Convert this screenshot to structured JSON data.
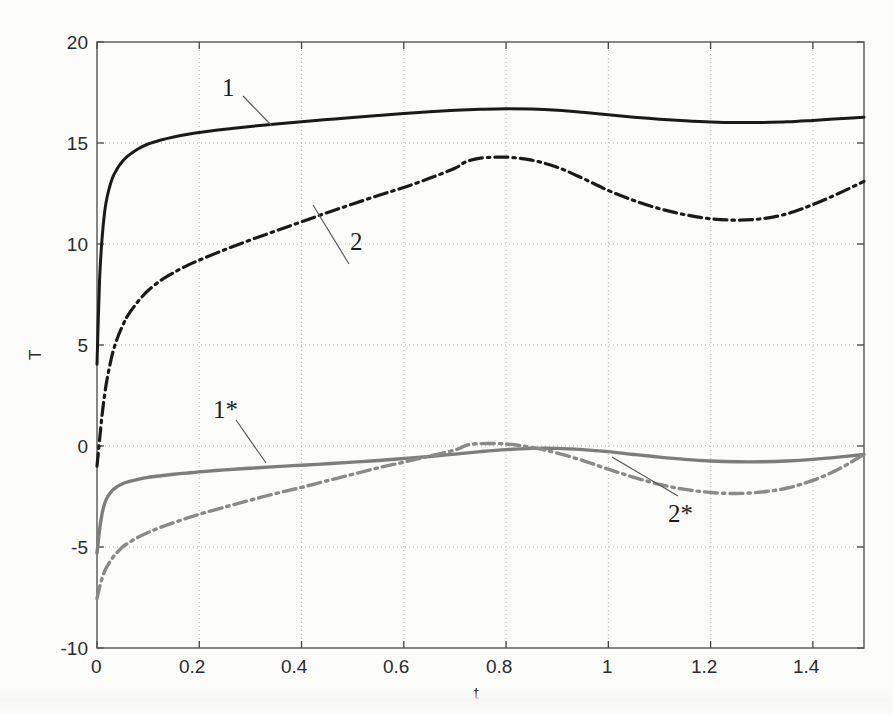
{
  "chart_data": {
    "type": "line",
    "title": "",
    "xlabel": "t",
    "ylabel": "T",
    "xlim": [
      0,
      1.5
    ],
    "ylim": [
      -10,
      20
    ],
    "grid": true,
    "legend_position": "inline-annotations",
    "xticks": [
      "0",
      "0.2",
      "0.4",
      "0.6",
      "0.8",
      "1",
      "1.2",
      "1.4"
    ],
    "xtick_values": [
      0,
      0.2,
      0.4,
      0.6,
      0.8,
      1,
      1.2,
      1.4
    ],
    "yticks": [
      "20",
      "15",
      "10",
      "5",
      "0",
      "-5",
      "-10"
    ],
    "ytick_values": [
      20,
      15,
      10,
      5,
      0,
      -5,
      -10
    ],
    "annotations": [
      {
        "label": "1",
        "x": 0.255,
        "y": 18.05
      },
      {
        "label": "2",
        "x": 0.505,
        "y": 10.45
      },
      {
        "label": "1*",
        "x": 0.24,
        "y": 2.2
      },
      {
        "label": "2*",
        "x": 0.74,
        "y": -5.45
      }
    ],
    "series": [
      {
        "name": "1",
        "style": "solid",
        "color": "#1a1a1a",
        "width": 3.0,
        "x": [
          0.0,
          0.005,
          0.01,
          0.015,
          0.02,
          0.03,
          0.04,
          0.05,
          0.06,
          0.08,
          0.1,
          0.125,
          0.15,
          0.175,
          0.2,
          0.25,
          0.3,
          0.35,
          0.4,
          0.45,
          0.5,
          0.55,
          0.6,
          0.65,
          0.7,
          0.75,
          0.8,
          0.85,
          0.9,
          0.95,
          1.0,
          1.05,
          1.1,
          1.15,
          1.2,
          1.25,
          1.3,
          1.35,
          1.4,
          1.45,
          1.5
        ],
        "y": [
          4.05,
          8.2,
          10.3,
          11.6,
          12.35,
          13.25,
          13.75,
          14.1,
          14.35,
          14.7,
          14.95,
          15.15,
          15.3,
          15.42,
          15.52,
          15.68,
          15.82,
          15.94,
          16.05,
          16.16,
          16.26,
          16.36,
          16.46,
          16.55,
          16.62,
          16.67,
          16.7,
          16.68,
          16.62,
          16.52,
          16.4,
          16.28,
          16.18,
          16.1,
          16.04,
          16.01,
          16.02,
          16.05,
          16.12,
          16.2,
          16.28
        ]
      },
      {
        "name": "2",
        "style": "dashdot",
        "color": "#1a1a1a",
        "width": 3.2,
        "x": [
          0.0,
          0.005,
          0.01,
          0.015,
          0.02,
          0.03,
          0.04,
          0.05,
          0.06,
          0.08,
          0.1,
          0.125,
          0.15,
          0.175,
          0.2,
          0.25,
          0.3,
          0.35,
          0.4,
          0.45,
          0.5,
          0.55,
          0.6,
          0.65,
          0.7,
          0.72,
          0.75,
          0.8,
          0.85,
          0.9,
          0.95,
          1.0,
          1.05,
          1.1,
          1.15,
          1.2,
          1.25,
          1.3,
          1.35,
          1.4,
          1.45,
          1.5
        ],
        "y": [
          -1.0,
          0.3,
          1.55,
          2.55,
          3.35,
          4.55,
          5.35,
          5.95,
          6.45,
          7.15,
          7.7,
          8.2,
          8.58,
          8.92,
          9.2,
          9.72,
          10.2,
          10.65,
          11.1,
          11.55,
          11.98,
          12.4,
          12.8,
          13.25,
          13.75,
          14.05,
          14.25,
          14.3,
          14.15,
          13.8,
          13.25,
          12.65,
          12.15,
          11.75,
          11.45,
          11.25,
          11.18,
          11.25,
          11.5,
          11.95,
          12.5,
          13.1
        ]
      },
      {
        "name": "1*",
        "style": "solid",
        "color": "#7d7d7d",
        "width": 3.4,
        "x": [
          0.0,
          0.005,
          0.01,
          0.015,
          0.02,
          0.03,
          0.04,
          0.05,
          0.06,
          0.08,
          0.1,
          0.125,
          0.15,
          0.175,
          0.2,
          0.25,
          0.3,
          0.35,
          0.4,
          0.45,
          0.5,
          0.55,
          0.6,
          0.65,
          0.7,
          0.75,
          0.8,
          0.85,
          0.9,
          0.95,
          1.0,
          1.05,
          1.1,
          1.15,
          1.2,
          1.25,
          1.3,
          1.35,
          1.4,
          1.45,
          1.5
        ],
        "y": [
          -5.3,
          -4.15,
          -3.35,
          -2.85,
          -2.55,
          -2.2,
          -2.0,
          -1.87,
          -1.78,
          -1.65,
          -1.55,
          -1.47,
          -1.4,
          -1.34,
          -1.28,
          -1.18,
          -1.1,
          -1.02,
          -0.95,
          -0.88,
          -0.8,
          -0.72,
          -0.62,
          -0.52,
          -0.4,
          -0.28,
          -0.18,
          -0.12,
          -0.12,
          -0.18,
          -0.28,
          -0.42,
          -0.55,
          -0.66,
          -0.74,
          -0.78,
          -0.78,
          -0.74,
          -0.66,
          -0.55,
          -0.42
        ]
      },
      {
        "name": "2*",
        "style": "dashdot",
        "color": "#8a8a8a",
        "width": 3.4,
        "x": [
          0.0,
          0.005,
          0.01,
          0.015,
          0.02,
          0.03,
          0.04,
          0.05,
          0.06,
          0.08,
          0.1,
          0.125,
          0.15,
          0.175,
          0.2,
          0.25,
          0.3,
          0.35,
          0.4,
          0.45,
          0.5,
          0.55,
          0.6,
          0.65,
          0.7,
          0.73,
          0.78,
          0.82,
          0.86,
          0.9,
          0.95,
          1.0,
          1.05,
          1.1,
          1.15,
          1.2,
          1.25,
          1.3,
          1.35,
          1.4,
          1.45,
          1.5
        ],
        "y": [
          -7.55,
          -7.0,
          -6.55,
          -6.2,
          -5.95,
          -5.55,
          -5.25,
          -5.0,
          -4.82,
          -4.52,
          -4.28,
          -4.02,
          -3.8,
          -3.58,
          -3.38,
          -3.02,
          -2.68,
          -2.35,
          -2.05,
          -1.72,
          -1.4,
          -1.08,
          -0.8,
          -0.5,
          -0.2,
          0.08,
          0.12,
          0.05,
          -0.12,
          -0.35,
          -0.72,
          -1.15,
          -1.55,
          -1.9,
          -2.15,
          -2.3,
          -2.35,
          -2.28,
          -2.08,
          -1.7,
          -1.15,
          -0.42
        ]
      }
    ]
  },
  "axis": {
    "xlabel": "t",
    "ylabel": "T"
  }
}
